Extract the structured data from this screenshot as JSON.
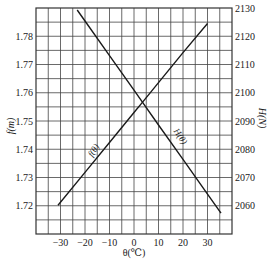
{
  "chart_data": {
    "type": "line",
    "title": "",
    "xlabel": "θ(℃)",
    "ylabel": "f(m)",
    "y2label": "H(N)",
    "xlim": [
      -40,
      40
    ],
    "ylim": [
      1.71,
      1.79
    ],
    "y2lim": [
      2050,
      2130
    ],
    "grid": true,
    "legend": "none (curves labeled inline)",
    "x_ticks": [
      -30,
      -20,
      -10,
      0,
      10,
      20,
      30
    ],
    "x_tick_labels": [
      "−30",
      "−20",
      "−10",
      "0",
      "10",
      "20",
      "30"
    ],
    "y_ticks": [
      1.72,
      1.73,
      1.74,
      1.75,
      1.76,
      1.77,
      1.78
    ],
    "y_tick_labels": [
      "1.72",
      "1.73",
      "1.74",
      "1.75",
      "1.76",
      "1.77",
      "1.78"
    ],
    "y2_ticks": [
      2060,
      2070,
      2080,
      2090,
      2100,
      2110,
      2120,
      2130
    ],
    "y2_tick_labels": [
      "2060",
      "2070",
      "2080",
      "2090",
      "2100",
      "2110",
      "2120",
      "2130"
    ],
    "series": [
      {
        "name": "f(θ)",
        "axis": "left",
        "x": [
          -31,
          -20,
          -10,
          0,
          3.5,
          10,
          20,
          30
        ],
        "values": [
          1.7202,
          1.7318,
          1.7424,
          1.753,
          1.7567,
          1.7636,
          1.7742,
          1.7845
        ]
      },
      {
        "name": "H(θ)",
        "axis": "right",
        "x": [
          -23.2,
          -20,
          -10,
          0,
          3.5,
          10,
          20,
          30,
          35.5
        ],
        "values": [
          2129.3,
          2125.4,
          2113.1,
          2100.9,
          2096.6,
          2088.6,
          2076.4,
          2064.1,
          2057.4
        ]
      }
    ],
    "annotations": [
      {
        "text": "f(θ)",
        "near_x": -15,
        "series": "f(θ)"
      },
      {
        "text": "H(θ)",
        "near_x": 16,
        "series": "H(θ)"
      }
    ],
    "intersection": {
      "x": 3.5,
      "f": 1.7565,
      "H": 2096.5
    }
  },
  "labels": {
    "ylabel": "f(m)",
    "y2label": "H(N)",
    "xlabel": "θ(℃)",
    "f_curve": "f(θ)",
    "h_curve": "H(θ)"
  }
}
